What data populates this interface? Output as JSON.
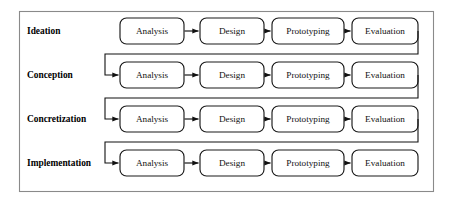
{
  "diagram": {
    "background_color": "#ffffff",
    "frame_color": "#8a8a8a",
    "node_border_color": "#1a1a1a",
    "node_fill_color": "#ffffff",
    "connector_color": "#111111",
    "frame": {
      "x": 19,
      "y": 11,
      "width": 415,
      "height": 181
    },
    "phases": [
      "Analysis",
      "Design",
      "Prototyping",
      "Evaluation"
    ],
    "phase_columns": [
      {
        "name": "Analysis",
        "x": 120,
        "width": 64
      },
      {
        "name": "Design",
        "x": 200,
        "width": 64
      },
      {
        "name": "Prototyping",
        "x": 272,
        "width": 72
      },
      {
        "name": "Evaluation",
        "x": 352,
        "width": 66
      }
    ],
    "row_height": 26,
    "rows": [
      {
        "label": "Ideation",
        "y": 18,
        "has_incoming_feedback": false,
        "has_outgoing_feedback": true,
        "nodes": [
          "Analysis",
          "Design",
          "Prototyping",
          "Evaluation"
        ]
      },
      {
        "label": "Conception",
        "y": 62,
        "has_incoming_feedback": true,
        "has_outgoing_feedback": true,
        "nodes": [
          "Analysis",
          "Design",
          "Prototyping",
          "Evaluation"
        ]
      },
      {
        "label": "Concretization",
        "y": 106,
        "has_incoming_feedback": true,
        "has_outgoing_feedback": true,
        "nodes": [
          "Analysis",
          "Design",
          "Prototyping",
          "Evaluation"
        ]
      },
      {
        "label": "Implementation",
        "y": 150,
        "has_incoming_feedback": true,
        "has_outgoing_feedback": false,
        "nodes": [
          "Analysis",
          "Design",
          "Prototyping",
          "Evaluation"
        ]
      }
    ],
    "row_label_x": 27,
    "feedback": {
      "exit_x": 418,
      "return_x": 105,
      "arrow_into": "Analysis",
      "description": "Evaluation of each row loops back to Analysis of the next row"
    }
  }
}
